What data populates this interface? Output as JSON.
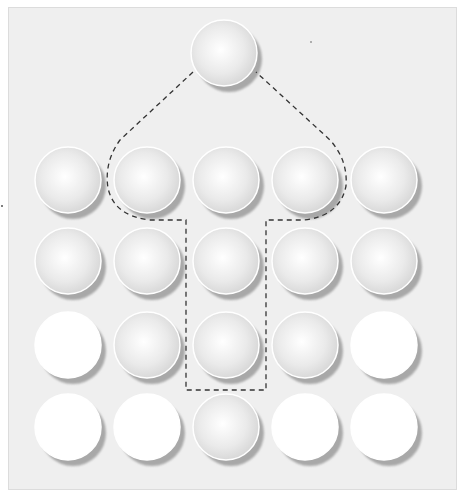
{
  "diagram": {
    "title": "",
    "background_color": "#efefef",
    "ball_styles": {
      "shaded": {
        "highlight": "#ffffff",
        "mid": "#eaeaea",
        "edge": "#d4d4d4",
        "shadow": "#a8a8a8"
      },
      "plain": {
        "fill": "#ffffff",
        "shadow": "#a8a8a8"
      }
    },
    "apex": {
      "id": "apex",
      "style": "shaded"
    },
    "grid": {
      "rows": 4,
      "cols": 5,
      "cells": [
        [
          "shaded",
          "shaded",
          "shaded",
          "shaded",
          "shaded"
        ],
        [
          "shaded",
          "shaded",
          "shaded",
          "shaded",
          "shaded"
        ],
        [
          "plain",
          "shaded",
          "shaded",
          "shaded",
          "plain"
        ],
        [
          "plain",
          "plain",
          "shaded",
          "plain",
          "plain"
        ]
      ]
    },
    "outline": {
      "style": "dashed",
      "color": "#333333",
      "description": "Arrow-shaped dashed outline enclosing the apex ball, row-1 columns 2-4, and center column rows 2-3"
    }
  }
}
